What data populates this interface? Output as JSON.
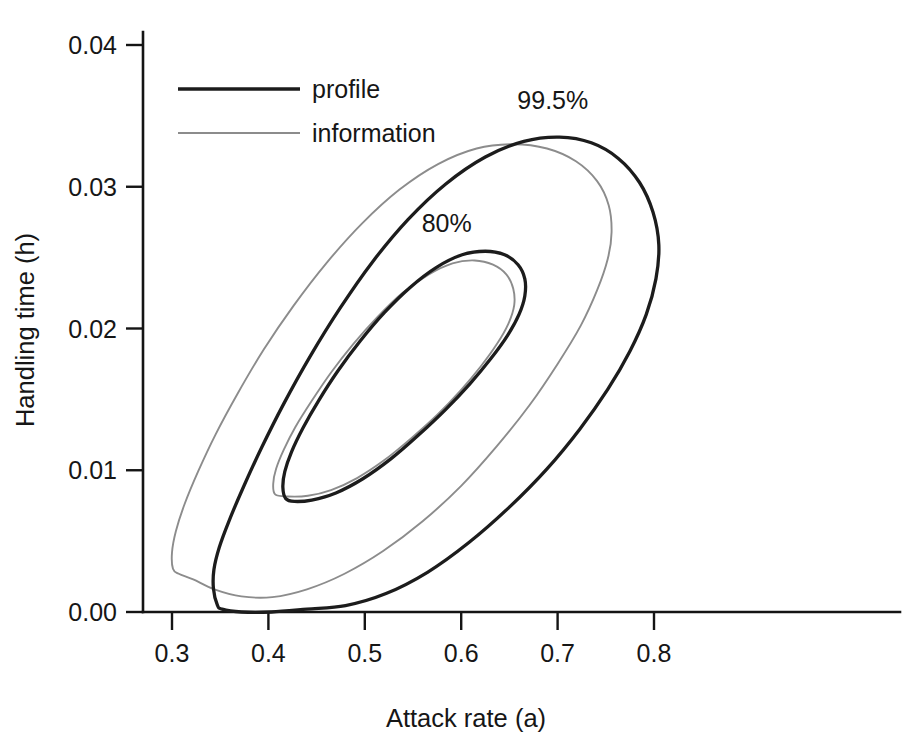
{
  "chart_data": {
    "type": "line",
    "title": "",
    "subtitle": "",
    "xlabel": "Attack rate (a)",
    "ylabel": "Handling time (h)",
    "xlim": [
      0.27,
      0.86
    ],
    "ylim": [
      -0.0013,
      0.0415
    ],
    "xticks": [
      0.3,
      0.4,
      0.5,
      0.6,
      0.7,
      0.8
    ],
    "xticklabels": [
      "0.3",
      "0.4",
      "0.5",
      "0.6",
      "0.7",
      "0.8"
    ],
    "yticks": [
      0.0,
      0.01,
      0.02,
      0.03,
      0.04
    ],
    "yticklabels": [
      "0.00",
      "0.01",
      "0.02",
      "0.03",
      "0.04"
    ],
    "grid": false,
    "legend_position": "upper-left",
    "legend": [
      {
        "name": "profile",
        "color": "#1c1c1c",
        "linewidth": "thick"
      },
      {
        "name": "information",
        "color": "#8c8c8c",
        "linewidth": "thin"
      }
    ],
    "annotations": [
      {
        "text": "99.5%",
        "x": 0.695,
        "y": 0.0355
      },
      {
        "text": "80%",
        "x": 0.585,
        "y": 0.0268
      }
    ],
    "series": [
      {
        "name": "profile 99.5%",
        "method": "profile",
        "level": "99.5%",
        "color": "#1c1c1c",
        "closed": true,
        "points": [
          [
            0.347,
            0.0005
          ],
          [
            0.343,
            0.00165
          ],
          [
            0.3435,
            0.003
          ],
          [
            0.349,
            0.00455
          ],
          [
            0.359,
            0.0064
          ],
          [
            0.374,
            0.0088
          ],
          [
            0.393,
            0.0116
          ],
          [
            0.416,
            0.0147
          ],
          [
            0.443,
            0.018
          ],
          [
            0.474,
            0.0214
          ],
          [
            0.508,
            0.0247
          ],
          [
            0.545,
            0.0277
          ],
          [
            0.584,
            0.0302
          ],
          [
            0.625,
            0.0321
          ],
          [
            0.665,
            0.0332
          ],
          [
            0.702,
            0.0335
          ],
          [
            0.735,
            0.0331
          ],
          [
            0.763,
            0.032
          ],
          [
            0.785,
            0.0303
          ],
          [
            0.799,
            0.0282
          ],
          [
            0.805,
            0.0259
          ],
          [
            0.802,
            0.0235
          ],
          [
            0.792,
            0.021
          ],
          [
            0.775,
            0.0184
          ],
          [
            0.752,
            0.0157
          ],
          [
            0.723,
            0.0129
          ],
          [
            0.689,
            0.0101
          ],
          [
            0.65,
            0.0074
          ],
          [
            0.608,
            0.0049
          ],
          [
            0.565,
            0.0028
          ],
          [
            0.522,
            0.0013
          ],
          [
            0.48,
            0.00045
          ],
          [
            0.44,
            0.0002
          ],
          [
            0.403,
            0.0
          ],
          [
            0.372,
            0.0
          ],
          [
            0.352,
            0.0002
          ],
          [
            0.347,
            0.0005
          ]
        ]
      },
      {
        "name": "information 99.5%",
        "method": "information",
        "level": "99.5%",
        "color": "#8c8c8c",
        "closed": true,
        "points": [
          [
            0.301,
            0.00305
          ],
          [
            0.3,
            0.0042
          ],
          [
            0.304,
            0.0057
          ],
          [
            0.313,
            0.0076
          ],
          [
            0.327,
            0.0099
          ],
          [
            0.345,
            0.0125
          ],
          [
            0.368,
            0.0154
          ],
          [
            0.395,
            0.0185
          ],
          [
            0.426,
            0.0216
          ],
          [
            0.46,
            0.0246
          ],
          [
            0.497,
            0.0274
          ],
          [
            0.536,
            0.0298
          ],
          [
            0.576,
            0.0316
          ],
          [
            0.616,
            0.0327
          ],
          [
            0.654,
            0.033
          ],
          [
            0.689,
            0.0327
          ],
          [
            0.719,
            0.0318
          ],
          [
            0.741,
            0.0304
          ],
          [
            0.753,
            0.0287
          ],
          [
            0.756,
            0.0268
          ],
          [
            0.752,
            0.0249
          ],
          [
            0.741,
            0.0227
          ],
          [
            0.724,
            0.0202
          ],
          [
            0.7,
            0.0175
          ],
          [
            0.671,
            0.0146
          ],
          [
            0.637,
            0.0117
          ],
          [
            0.6,
            0.0089
          ],
          [
            0.56,
            0.0064
          ],
          [
            0.519,
            0.0043
          ],
          [
            0.479,
            0.0027
          ],
          [
            0.44,
            0.0016
          ],
          [
            0.404,
            0.00105
          ],
          [
            0.372,
            0.0011
          ],
          [
            0.344,
            0.0016
          ],
          [
            0.322,
            0.0023
          ],
          [
            0.307,
            0.0027
          ],
          [
            0.301,
            0.00305
          ]
        ]
      },
      {
        "name": "profile 80%",
        "method": "profile",
        "level": "80%",
        "color": "#1c1c1c",
        "closed": true,
        "points": [
          [
            0.418,
            0.008
          ],
          [
            0.415,
            0.0088
          ],
          [
            0.417,
            0.0099
          ],
          [
            0.424,
            0.0113
          ],
          [
            0.436,
            0.013
          ],
          [
            0.452,
            0.0149
          ],
          [
            0.472,
            0.017
          ],
          [
            0.495,
            0.0191
          ],
          [
            0.52,
            0.0211
          ],
          [
            0.547,
            0.0229
          ],
          [
            0.574,
            0.0243
          ],
          [
            0.601,
            0.0252
          ],
          [
            0.625,
            0.02545
          ],
          [
            0.645,
            0.0252
          ],
          [
            0.659,
            0.0245
          ],
          [
            0.666,
            0.0235
          ],
          [
            0.666,
            0.0223
          ],
          [
            0.66,
            0.021
          ],
          [
            0.648,
            0.0195
          ],
          [
            0.631,
            0.0179
          ],
          [
            0.609,
            0.0161
          ],
          [
            0.584,
            0.0143
          ],
          [
            0.556,
            0.0125
          ],
          [
            0.527,
            0.0108
          ],
          [
            0.498,
            0.0094
          ],
          [
            0.47,
            0.0084
          ],
          [
            0.445,
            0.0079
          ],
          [
            0.427,
            0.0078
          ],
          [
            0.418,
            0.008
          ]
        ]
      },
      {
        "name": "information 80%",
        "method": "information",
        "level": "80%",
        "color": "#8c8c8c",
        "closed": true,
        "points": [
          [
            0.407,
            0.0083
          ],
          [
            0.405,
            0.00905
          ],
          [
            0.408,
            0.0101
          ],
          [
            0.416,
            0.01145
          ],
          [
            0.428,
            0.01305
          ],
          [
            0.445,
            0.0149
          ],
          [
            0.465,
            0.0169
          ],
          [
            0.488,
            0.0189
          ],
          [
            0.513,
            0.0208
          ],
          [
            0.539,
            0.0225
          ],
          [
            0.566,
            0.0238
          ],
          [
            0.591,
            0.0246
          ],
          [
            0.614,
            0.0248
          ],
          [
            0.633,
            0.0245
          ],
          [
            0.647,
            0.0238
          ],
          [
            0.654,
            0.0228
          ],
          [
            0.655,
            0.02165
          ],
          [
            0.649,
            0.02035
          ],
          [
            0.637,
            0.0189
          ],
          [
            0.62,
            0.0173
          ],
          [
            0.599,
            0.0156
          ],
          [
            0.575,
            0.0139
          ],
          [
            0.548,
            0.01225
          ],
          [
            0.52,
            0.0107
          ],
          [
            0.492,
            0.00945
          ],
          [
            0.465,
            0.0086
          ],
          [
            0.441,
            0.0082
          ],
          [
            0.42,
            0.00815
          ],
          [
            0.407,
            0.0083
          ]
        ]
      }
    ]
  },
  "axes": {
    "xlabel": "Attack rate (a)",
    "ylabel": "Handling time (h)"
  },
  "legend": {
    "items": [
      {
        "label": "profile"
      },
      {
        "label": "information"
      }
    ]
  },
  "contour_labels": {
    "outer": "99.5%",
    "inner": "80%"
  }
}
